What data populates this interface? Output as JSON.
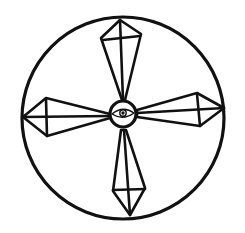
{
  "image": {
    "description": "Hand-drawn symbol: a large circle containing four elongated diamond-shaped arms in a cross pattern radiating from a small central circle with an eye inside",
    "stroke_color": "#111111",
    "background_color": "#ffffff"
  }
}
